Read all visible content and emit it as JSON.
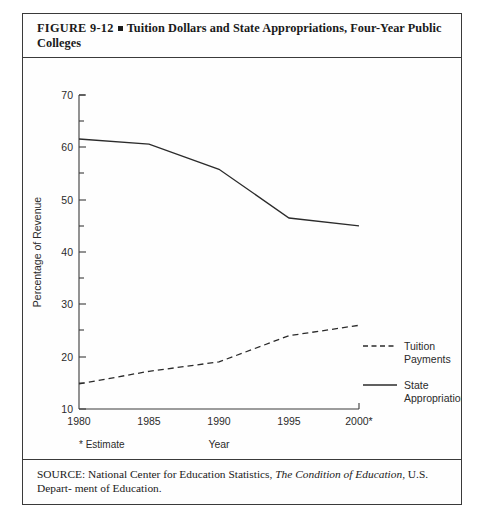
{
  "figure": {
    "caption_label": "FIGURE  9-12",
    "caption_text_line1": "Tuition Dollars and State Appropriations, Four-Year Public",
    "caption_text_line2": "Colleges",
    "bullet_icon": "filled-square-bullet",
    "source_prefix": "SOURCE:",
    "source_part1": " National Center for Education Statistics, ",
    "source_italic": "The Condition of Education",
    "source_part2": ", U.S. Depart-",
    "source_line2": "ment of Education."
  },
  "chart_data": {
    "type": "line",
    "title": "Tuition Dollars and State Appropriations, Four-Year Public Colleges",
    "xlabel": "Year",
    "ylabel": "Percentage of Revenue",
    "x": [
      1980,
      1985,
      1990,
      1995,
      2000
    ],
    "categories": [
      "1980",
      "1985",
      "1990",
      "1995",
      "2000*"
    ],
    "xlim": [
      1980,
      2000
    ],
    "ylim": [
      10,
      70
    ],
    "ytick_labels": [
      "10",
      "20",
      "30",
      "40",
      "50",
      "60",
      "70"
    ],
    "ytick_values": [
      10,
      20,
      30,
      40,
      50,
      60,
      70
    ],
    "yminor_values": [
      15,
      25,
      35,
      45,
      55,
      65
    ],
    "grid": false,
    "legend_position": "right-inside",
    "footnote": "* Estimate",
    "series": [
      {
        "name": "Tuition Payments",
        "label_line1": "Tuition",
        "label_line2": "Payments",
        "style": "dashed",
        "color": "#2b2b2b",
        "values": [
          14.8,
          17.2,
          19.0,
          24.0,
          26.0
        ]
      },
      {
        "name": "State Appropriations",
        "label_line1": "State",
        "label_line2": "Appropriations",
        "style": "solid",
        "color": "#2b2b2b",
        "values": [
          61.6,
          60.6,
          55.8,
          46.5,
          45.0
        ]
      }
    ]
  },
  "axis": {
    "tick_1980": "1980",
    "tick_1985": "1985",
    "tick_1990": "1990",
    "tick_1995": "1995",
    "tick_2000": "2000*",
    "y_10": "10",
    "y_20": "20",
    "y_30": "30",
    "y_40": "40",
    "y_50": "50",
    "y_60": "60",
    "y_70": "70"
  }
}
